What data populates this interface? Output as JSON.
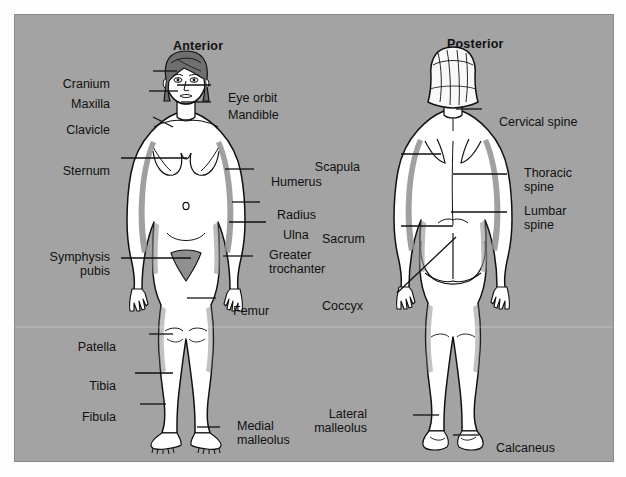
{
  "figure": {
    "background_color": "#a3a3a3",
    "ink_color": "#111111",
    "body_fill": "#ffffff",
    "shade_color": "#8f8f8f",
    "hair_color": "#6f6f6f"
  },
  "views": {
    "anterior": {
      "heading": "Anterior"
    },
    "posterior": {
      "heading": "Posterior"
    }
  },
  "labels": {
    "anterior": [
      {
        "id": "cranium",
        "text": "Cranium",
        "line2": "",
        "align": "right",
        "x": 95,
        "y": 63,
        "leader": [
          152,
          70,
          176,
          70
        ]
      },
      {
        "id": "eye-orbit",
        "text": "Eye orbit",
        "line2": "",
        "align": "left",
        "x": 213,
        "y": 77,
        "leader": [
          176,
          84,
          210,
          84
        ]
      },
      {
        "id": "maxilla",
        "text": "Maxilla",
        "line2": "",
        "align": "right",
        "x": 95,
        "y": 83,
        "leader": [
          148,
          90,
          177,
          90
        ]
      },
      {
        "id": "mandible",
        "text": "Mandible",
        "line2": "",
        "align": "left",
        "x": 213,
        "y": 94,
        "leader": [
          180,
          101,
          210,
          101
        ]
      },
      {
        "id": "clavicle",
        "text": "Clavicle",
        "line2": "",
        "align": "right",
        "x": 95,
        "y": 109,
        "leader": [
          152,
          116,
          172,
          126
        ]
      },
      {
        "id": "sternum",
        "text": "Sternum",
        "line2": "",
        "align": "right",
        "x": 95,
        "y": 150,
        "leader": [
          120,
          157,
          186,
          157
        ]
      },
      {
        "id": "humerus",
        "text": "Humerus",
        "line2": "",
        "align": "left",
        "x": 256,
        "y": 161,
        "leader": [
          224,
          168,
          253,
          168
        ]
      },
      {
        "id": "radius",
        "text": "Radius",
        "line2": "",
        "align": "left",
        "x": 262,
        "y": 194,
        "leader": [
          231,
          201,
          259,
          201
        ]
      },
      {
        "id": "ulna",
        "text": "Ulna",
        "line2": "",
        "align": "left",
        "x": 268,
        "y": 214,
        "leader": [
          228,
          221,
          265,
          221
        ]
      },
      {
        "id": "greater-trochanter",
        "text": "Greater",
        "line2": "trochanter",
        "align": "left",
        "x": 256,
        "y": 234,
        "leader": [
          222,
          255,
          252,
          255
        ]
      },
      {
        "id": "symphysis-pubis",
        "text": "Symphysis",
        "line2": "pubis",
        "align": "right",
        "x": 95,
        "y": 236,
        "leader": [
          120,
          257,
          190,
          257
        ]
      },
      {
        "id": "femur",
        "text": "Femur",
        "line2": "",
        "align": "left",
        "x": 218,
        "y": 290,
        "leader": [
          186,
          297,
          215,
          297
        ]
      },
      {
        "id": "patella",
        "text": "Patella",
        "line2": "",
        "align": "right",
        "x": 101,
        "y": 326,
        "leader": [
          148,
          333,
          172,
          333
        ]
      },
      {
        "id": "tibia",
        "text": "Tibia",
        "line2": "",
        "align": "right",
        "x": 101,
        "y": 365,
        "leader": [
          134,
          372,
          172,
          372
        ]
      },
      {
        "id": "fibula",
        "text": "Fibula",
        "line2": "",
        "align": "right",
        "x": 101,
        "y": 396,
        "leader": [
          139,
          403,
          165,
          403
        ]
      },
      {
        "id": "medial-malleolus",
        "text": "Medial",
        "line2": "malleolus",
        "align": "left",
        "x": 222,
        "y": 405,
        "leader": [
          196,
          426,
          219,
          426
        ]
      }
    ],
    "posterior": [
      {
        "id": "cervical-spine",
        "text": "Cervical spine",
        "line2": "",
        "align": "left",
        "x": 484,
        "y": 101,
        "leader": [
          455,
          108,
          481,
          108
        ]
      },
      {
        "id": "scapula",
        "text": "Scapula",
        "line2": "",
        "align": "right",
        "x": 345,
        "y": 146,
        "leader": [
          400,
          153,
          440,
          153
        ]
      },
      {
        "id": "thoracic-spine",
        "text": "Thoracic",
        "line2": "spine",
        "align": "left",
        "x": 509,
        "y": 152,
        "leader": [
          452,
          173,
          506,
          173
        ]
      },
      {
        "id": "lumbar-spine",
        "text": "Lumbar",
        "line2": "spine",
        "align": "left",
        "x": 509,
        "y": 190,
        "leader": [
          450,
          211,
          506,
          211
        ]
      },
      {
        "id": "sacrum",
        "text": "Sacrum",
        "line2": "",
        "align": "right",
        "x": 350,
        "y": 218,
        "leader": [
          400,
          225,
          452,
          225
        ]
      },
      {
        "id": "coccyx",
        "text": "Coccyx",
        "line2": "",
        "align": "right",
        "x": 348,
        "y": 285,
        "leader": [
          396,
          292,
          455,
          236
        ]
      },
      {
        "id": "lateral-malleolus",
        "text": "Lateral",
        "line2": "malleolus",
        "align": "right",
        "x": 352,
        "y": 393,
        "leader": [
          412,
          414,
          438,
          414
        ]
      },
      {
        "id": "calcaneus",
        "text": "Calcaneus",
        "line2": "",
        "align": "left",
        "x": 481,
        "y": 427,
        "leader": [
          452,
          434,
          478,
          434
        ]
      }
    ]
  }
}
